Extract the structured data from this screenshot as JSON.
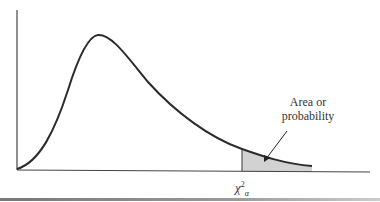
{
  "figure": {
    "type": "chi-square distribution density curve",
    "annotation": {
      "line1": "Area or",
      "line2": "probability"
    },
    "critical_value": {
      "symbol": "χ",
      "superscript": "2",
      "subscript": "α"
    },
    "colors": {
      "curve": "#2b2b2b",
      "shaded_area": "#d0d0d0",
      "axis": "#444444"
    }
  }
}
